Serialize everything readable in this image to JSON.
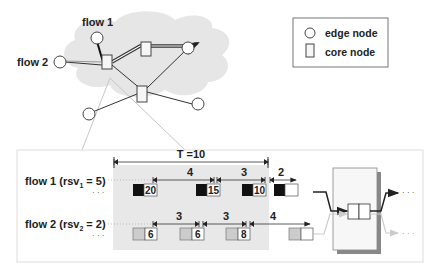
{
  "network": {
    "flow1_label": "flow 1",
    "flow2_label": "flow 2"
  },
  "legend": {
    "edge_label": "edge node",
    "core_label": "core node"
  },
  "detail": {
    "period_label": "T =10",
    "flow1": {
      "label_main": "flow 1 (rsv",
      "label_sub": "1",
      "label_tail": " = 5)",
      "ellipsis": "· · ·",
      "packets": [
        "20",
        "15",
        "10",
        ""
      ],
      "gaps": [
        "4",
        "3",
        "2"
      ]
    },
    "flow2": {
      "label_main": "flow 2 (rsv",
      "label_sub": "2",
      "label_tail": " = 2)",
      "ellipsis": "· · ·",
      "packets": [
        "6",
        "6",
        "8",
        ""
      ],
      "gaps": [
        "3",
        "3",
        "4"
      ]
    },
    "output_ellipsis": "· · ·"
  },
  "colors": {
    "cloud": "#e6e6e6",
    "shade": "#e8e8e8",
    "flow1_packet": "#111111",
    "flow2_packet": "#cccccc",
    "line": "#333333",
    "light_line": "#c8c8c8"
  }
}
